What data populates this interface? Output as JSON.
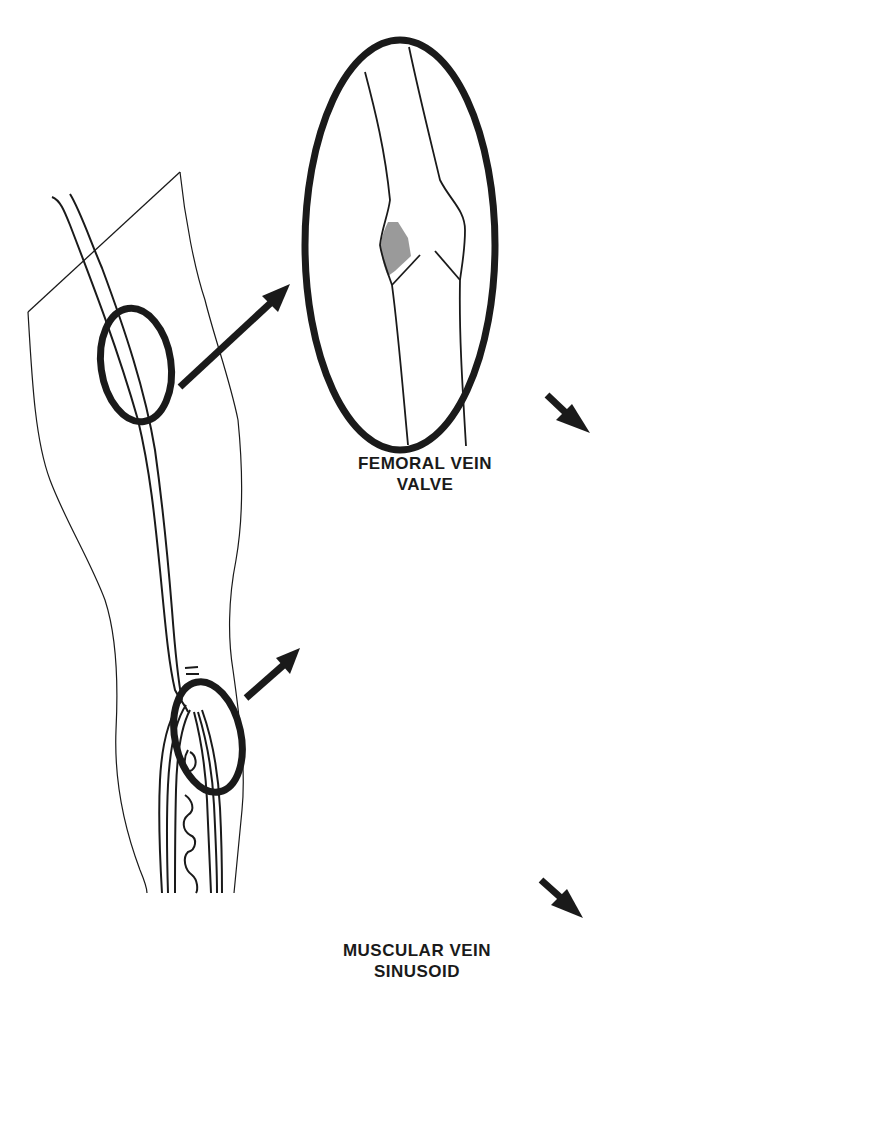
{
  "figure": {
    "type": "anatomical-diagram",
    "colors": {
      "line": "#1a1a1a",
      "thrombus_fill": "#9a9a9a",
      "background": "#ffffff"
    }
  },
  "labels": {
    "femoral": {
      "line1": "FEMORAL VEIN",
      "line2": "VALVE"
    },
    "muscular": {
      "line1": "MUSCULAR VEIN",
      "line2": "SINUSOID"
    }
  },
  "panels": [
    {
      "id": "leg-overview",
      "description": "Leg outline with femoral vein and calf muscle veins; two circled regions"
    },
    {
      "id": "femoral-valve-early",
      "description": "Femoral vein valve with small thrombus in valve pocket"
    },
    {
      "id": "femoral-valve-propagated",
      "description": "Femoral vein valve with thrombus propagated proximally"
    },
    {
      "id": "sinusoid-early",
      "description": "Muscular vein sinusoid with thrombus"
    },
    {
      "id": "sinusoid-propagated",
      "description": "Muscular vein sinusoid thrombus extending into adjacent vein"
    }
  ]
}
